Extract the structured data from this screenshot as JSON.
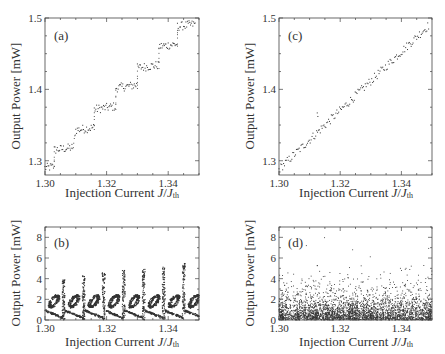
{
  "chart_data": [
    {
      "id": "a",
      "type": "scatter",
      "panel_label": "(a)",
      "xlabel": "Injection Current J/Jth",
      "ylabel": "Output Power [mW]",
      "xlim": [
        1.3,
        1.35
      ],
      "ylim": [
        1.28,
        1.5
      ],
      "xticks": [
        "1.30",
        "1.32",
        "1.34"
      ],
      "yticks": [
        "1.3",
        "1.4",
        "1.5"
      ],
      "description": "Staircase-like increase of output power with injection current",
      "steps": [
        {
          "x0": 1.3,
          "x1": 1.303,
          "y": 1.29
        },
        {
          "x0": 1.303,
          "x1": 1.309,
          "y": 1.315
        },
        {
          "x0": 1.31,
          "x1": 1.316,
          "y": 1.343
        },
        {
          "x0": 1.316,
          "x1": 1.323,
          "y": 1.372
        },
        {
          "x0": 1.323,
          "x1": 1.33,
          "y": 1.402
        },
        {
          "x0": 1.33,
          "x1": 1.337,
          "y": 1.43
        },
        {
          "x0": 1.337,
          "x1": 1.343,
          "y": 1.46
        },
        {
          "x0": 1.343,
          "x1": 1.349,
          "y": 1.488
        }
      ]
    },
    {
      "id": "c",
      "type": "scatter",
      "panel_label": "(c)",
      "xlabel": "Injection Current J/Jth",
      "ylabel": "Output Power [mW]",
      "xlim": [
        1.3,
        1.35
      ],
      "ylim": [
        1.28,
        1.5
      ],
      "xticks": [
        "1.30",
        "1.32",
        "1.34"
      ],
      "yticks": [
        "1.3",
        "1.4",
        "1.5"
      ],
      "description": "Nearly linear increase of output power with injection current",
      "line": {
        "x0": 1.3,
        "y0": 1.288,
        "x1": 1.349,
        "y1": 1.49
      }
    },
    {
      "id": "b",
      "type": "scatter",
      "panel_label": "(b)",
      "xlabel": "Injection Current J/Jth",
      "ylabel": "Output Power [mW]",
      "xlim": [
        1.3,
        1.35
      ],
      "ylim": [
        0,
        9
      ],
      "xticks": [
        "1.30",
        "1.32",
        "1.34"
      ],
      "yticks": [
        "0",
        "2",
        "4",
        "6",
        "8"
      ],
      "description": "Periodic bifurcation structure: repeated loops near 2 mW and spikes up to ~5 mW",
      "periods_x": [
        1.3,
        1.3065,
        1.313,
        1.3195,
        1.326,
        1.3325,
        1.339,
        1.3455
      ],
      "spike_max": [
        4.0,
        4.3,
        4.6,
        4.8,
        4.9,
        5.2,
        5.6,
        5.3
      ]
    },
    {
      "id": "d",
      "type": "scatter",
      "panel_label": "(d)",
      "xlabel": "Injection Current J/Jth",
      "ylabel": "Output Power [mW]",
      "xlim": [
        1.3,
        1.35
      ],
      "ylim": [
        0,
        9
      ],
      "xticks": [
        "1.30",
        "1.32",
        "1.34"
      ],
      "yticks": [
        "0",
        "2",
        "4",
        "6",
        "8"
      ],
      "description": "Chaotic scatter dense below 2 mW with sparse points up to ~8 mW"
    }
  ],
  "panels": {
    "a": {
      "label": "(a)",
      "xlabel_main": "Injection Current ",
      "xlabel_var": "J",
      "xlabel_sep": "/",
      "xlabel_var2": "J",
      "xlabel_sub": "th",
      "ylabel": "Output Power [mW]"
    },
    "b": {
      "label": "(b)",
      "xlabel_main": "Injection Current ",
      "xlabel_var": "J",
      "xlabel_sep": "/",
      "xlabel_var2": "J",
      "xlabel_sub": "th",
      "ylabel": "Output Power [mW]"
    },
    "c": {
      "label": "(c)",
      "xlabel_main": "Injection Current ",
      "xlabel_var": "J",
      "xlabel_sep": "/",
      "xlabel_var2": "J",
      "xlabel_sub": "th",
      "ylabel": "Output Power [mW]"
    },
    "d": {
      "label": "(d)",
      "xlabel_main": "Injection Current ",
      "xlabel_var": "J",
      "xlabel_sep": "/",
      "xlabel_var2": "J",
      "xlabel_sub": "th",
      "ylabel": "Output Power [mW]"
    }
  },
  "colors": {
    "frame": "#444444",
    "points": "#333333",
    "text": "#333333"
  }
}
